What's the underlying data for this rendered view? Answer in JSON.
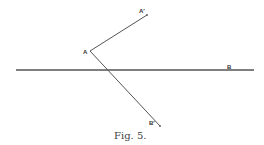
{
  "figure": {
    "caption": "Fig. 5.",
    "labels": {
      "vertex": "A",
      "upper_end": "A′",
      "lower_end": "B′",
      "line_end": "B"
    },
    "line_color": "#555555"
  }
}
